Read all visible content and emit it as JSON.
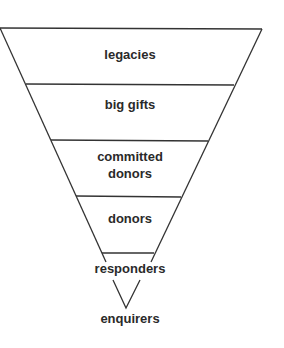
{
  "diagram": {
    "type": "inverted-funnel",
    "line_color": "#333333",
    "stages": [
      {
        "label": "legacies"
      },
      {
        "label": "big gifts"
      },
      {
        "label": "committed donors",
        "line1": "committed",
        "line2": "donors"
      },
      {
        "label": "donors"
      },
      {
        "label": "responders"
      },
      {
        "label": "enquirers"
      }
    ]
  }
}
